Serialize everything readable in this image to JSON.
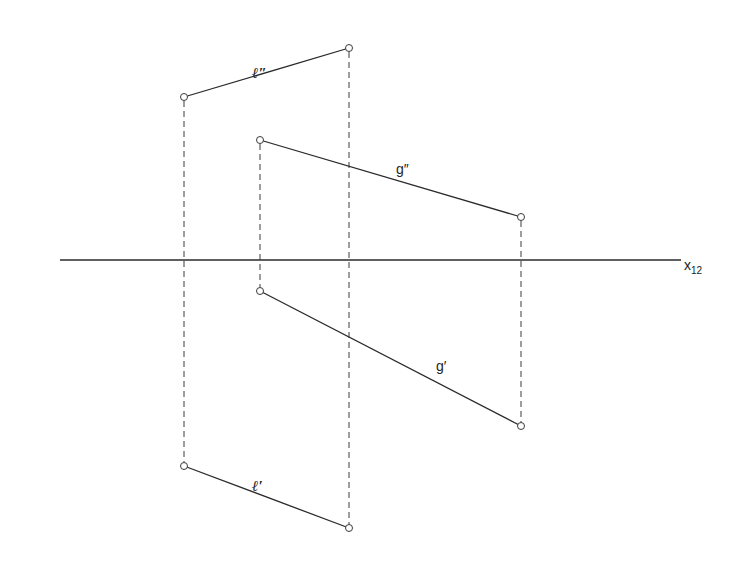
{
  "diagram": {
    "type": "descriptive-geometry-projection",
    "axis": {
      "label": "x",
      "subscript": "12",
      "x1": 60,
      "x2": 681,
      "y": 260
    },
    "lines": [
      {
        "name": "l-double-prime",
        "label": "ℓ″",
        "p1": [
          184,
          97
        ],
        "p2": [
          349,
          48
        ],
        "label_pos": [
          258,
          75
        ]
      },
      {
        "name": "g-double-prime",
        "label": "g″",
        "p1": [
          260,
          140
        ],
        "p2": [
          521,
          217
        ],
        "label_pos": [
          397,
          172
        ]
      },
      {
        "name": "g-prime",
        "label": "g′",
        "p1": [
          260,
          291
        ],
        "p2": [
          521,
          426
        ],
        "label_pos": [
          436,
          369
        ]
      },
      {
        "name": "l-prime",
        "label": "ℓ′",
        "p1": [
          184,
          466
        ],
        "p2": [
          349,
          528
        ],
        "label_pos": [
          258,
          488
        ]
      }
    ],
    "ordering_lines": [
      {
        "x": 184,
        "y1": 97,
        "y2": 466
      },
      {
        "x": 349,
        "y1": 48,
        "y2": 528
      },
      {
        "x": 260,
        "y1": 140,
        "y2": 291
      },
      {
        "x": 521,
        "y1": 217,
        "y2": 426
      }
    ],
    "labels": {
      "l_double": "ℓ″",
      "g_double": "g″",
      "g_single": "g′",
      "l_single": "ℓ′",
      "axis_main": "x",
      "axis_sub": "12"
    }
  }
}
